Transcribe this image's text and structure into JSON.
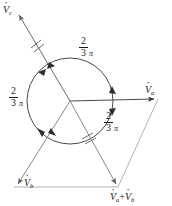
{
  "figure": {
    "type": "phasor-diagram",
    "canvas": {
      "width": 172,
      "height": 206
    },
    "colors": {
      "stroke_dark": "#3a3a3a",
      "stroke_mid": "#6e6e6e",
      "stroke_light": "#9a9a9a",
      "text": "#1a1a1a",
      "background": "#ffffff"
    },
    "circle": {
      "cx": 70,
      "cy": 101,
      "r": 43
    },
    "phasors": [
      {
        "name": "Va",
        "label_symbol": "V",
        "label_sub": "a",
        "angle_deg": 0,
        "tip": [
          158,
          99
        ],
        "label_pos": [
          146,
          86
        ]
      },
      {
        "name": "Vb",
        "label_symbol": "V",
        "label_sub": "b",
        "angle_deg": 240,
        "tip": [
          14,
          187
        ],
        "label_pos": [
          24,
          179
        ]
      },
      {
        "name": "Vc",
        "label_symbol": "V",
        "label_sub": "c",
        "angle_deg": 120,
        "tip": [
          16,
          12
        ],
        "label_pos": [
          3,
          4
        ]
      }
    ],
    "resultant": {
      "name": "Va+Vb",
      "label_symbol_1": "V",
      "label_sub_1": "a",
      "plus": "+",
      "label_symbol_2": "V",
      "label_sub_2": "b",
      "vertex": [
        118,
        187
      ],
      "label_pos": [
        113,
        193
      ]
    },
    "angle_labels": [
      {
        "name": "angle-top",
        "numerator": "2",
        "denominator": "3",
        "symbol": "π",
        "pos": [
          80,
          38
        ]
      },
      {
        "name": "angle-left",
        "numerator": "2",
        "denominator": "3",
        "symbol": "π",
        "pos": [
          10,
          88
        ]
      },
      {
        "name": "angle-lower-right",
        "numerator": "2",
        "denominator": "3",
        "symbol": "π",
        "pos": [
          105,
          113
        ]
      }
    ],
    "tick_marks": [
      {
        "name": "tick-vc-line",
        "pos": [
          36,
          43
        ]
      },
      {
        "name": "tick-vab-line",
        "pos": [
          87,
          137
        ]
      }
    ],
    "arc_arrowheads": 6
  }
}
